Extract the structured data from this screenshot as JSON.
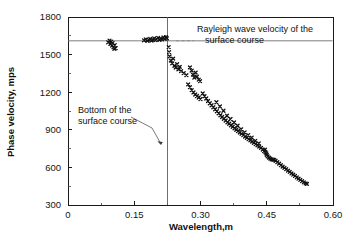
{
  "chart_data": {
    "type": "scatter",
    "title": "",
    "xlabel": "Wavelength,m",
    "ylabel": "Phase velocity, mps",
    "xlim": [
      0,
      0.6
    ],
    "ylim": [
      300,
      1800
    ],
    "xticks": [
      0,
      0.15,
      0.3,
      0.45,
      0.6
    ],
    "xtick_labels": [
      "0",
      "0.15",
      "0.30",
      "0.45",
      "0.60"
    ],
    "yticks": [
      300,
      600,
      900,
      1200,
      1500,
      1800
    ],
    "ytick_labels": [
      "300",
      "600",
      "900",
      "1200",
      "1500",
      "1800"
    ],
    "minor_ticks": true,
    "grid": false,
    "legend": "none",
    "marker": "cross",
    "marker_color": "#111111",
    "reference_lines": [
      {
        "name": "rayleigh-wave-velocity",
        "orientation": "horizontal",
        "value": 1610,
        "label": "Rayleigh wave velocity of the surface course"
      },
      {
        "name": "bottom-of-surface-course",
        "orientation": "vertical",
        "value": 0.225,
        "label": "Bottom of the surface course"
      }
    ],
    "annotations": [
      {
        "name": "rayleigh-annotation",
        "text_line1": "Rayleigh wave velocity of the",
        "text_line2": "surface course",
        "x": 0.375,
        "y": 1700
      },
      {
        "name": "bottom-annotation",
        "text_line1": "Bottom of the",
        "text_line2": "surface course",
        "x": 0.065,
        "y": 1030
      }
    ],
    "points": [
      [
        0.091,
        1598
      ],
      [
        0.094,
        1612
      ],
      [
        0.096,
        1585
      ],
      [
        0.098,
        1604
      ],
      [
        0.1,
        1572
      ],
      [
        0.101,
        1592
      ],
      [
        0.103,
        1560
      ],
      [
        0.105,
        1546
      ],
      [
        0.106,
        1576
      ],
      [
        0.108,
        1552
      ],
      [
        0.172,
        1614
      ],
      [
        0.176,
        1622
      ],
      [
        0.18,
        1610
      ],
      [
        0.183,
        1618
      ],
      [
        0.186,
        1626
      ],
      [
        0.189,
        1612
      ],
      [
        0.192,
        1620
      ],
      [
        0.195,
        1630
      ],
      [
        0.198,
        1616
      ],
      [
        0.201,
        1624
      ],
      [
        0.204,
        1634
      ],
      [
        0.207,
        1618
      ],
      [
        0.21,
        1628
      ],
      [
        0.213,
        1622
      ],
      [
        0.216,
        1636
      ],
      [
        0.219,
        1626
      ],
      [
        0.222,
        1640
      ],
      [
        0.224,
        1630
      ],
      [
        0.228,
        1560
      ],
      [
        0.229,
        1520
      ],
      [
        0.23,
        1486
      ],
      [
        0.233,
        1452
      ],
      [
        0.236,
        1430
      ],
      [
        0.238,
        1468
      ],
      [
        0.241,
        1410
      ],
      [
        0.244,
        1396
      ],
      [
        0.247,
        1424
      ],
      [
        0.25,
        1382
      ],
      [
        0.253,
        1402
      ],
      [
        0.256,
        1368
      ],
      [
        0.262,
        1352
      ],
      [
        0.268,
        1336
      ],
      [
        0.276,
        1398
      ],
      [
        0.28,
        1372
      ],
      [
        0.283,
        1340
      ],
      [
        0.286,
        1316
      ],
      [
        0.289,
        1356
      ],
      [
        0.292,
        1324
      ],
      [
        0.296,
        1300
      ],
      [
        0.299,
        1288
      ],
      [
        0.272,
        1262
      ],
      [
        0.276,
        1240
      ],
      [
        0.28,
        1216
      ],
      [
        0.284,
        1198
      ],
      [
        0.288,
        1182
      ],
      [
        0.292,
        1170
      ],
      [
        0.296,
        1158
      ],
      [
        0.3,
        1146
      ],
      [
        0.305,
        1190
      ],
      [
        0.309,
        1168
      ],
      [
        0.313,
        1150
      ],
      [
        0.317,
        1130
      ],
      [
        0.321,
        1112
      ],
      [
        0.325,
        1096
      ],
      [
        0.329,
        1080
      ],
      [
        0.333,
        1064
      ],
      [
        0.337,
        1048
      ],
      [
        0.341,
        1032
      ],
      [
        0.345,
        1016
      ],
      [
        0.349,
        1002
      ],
      [
        0.353,
        988
      ],
      [
        0.357,
        974
      ],
      [
        0.361,
        960
      ],
      [
        0.365,
        948
      ],
      [
        0.369,
        936
      ],
      [
        0.373,
        924
      ],
      [
        0.377,
        912
      ],
      [
        0.381,
        900
      ],
      [
        0.385,
        890
      ],
      [
        0.389,
        878
      ],
      [
        0.393,
        868
      ],
      [
        0.397,
        858
      ],
      [
        0.401,
        846
      ],
      [
        0.405,
        836
      ],
      [
        0.409,
        826
      ],
      [
        0.413,
        816
      ],
      [
        0.417,
        806
      ],
      [
        0.421,
        796
      ],
      [
        0.425,
        786
      ],
      [
        0.429,
        776
      ],
      [
        0.433,
        766
      ],
      [
        0.336,
        1120
      ],
      [
        0.344,
        1086
      ],
      [
        0.352,
        1052
      ],
      [
        0.36,
        1012
      ],
      [
        0.368,
        986
      ],
      [
        0.376,
        958
      ],
      [
        0.384,
        932
      ],
      [
        0.392,
        904
      ],
      [
        0.4,
        880
      ],
      [
        0.408,
        858
      ],
      [
        0.416,
        838
      ],
      [
        0.424,
        812
      ],
      [
        0.432,
        792
      ],
      [
        0.437,
        756
      ],
      [
        0.441,
        742
      ],
      [
        0.444,
        730
      ],
      [
        0.447,
        722
      ],
      [
        0.45,
        700
      ],
      [
        0.452,
        688
      ],
      [
        0.455,
        678
      ],
      [
        0.458,
        670
      ],
      [
        0.461,
        664
      ],
      [
        0.464,
        662
      ],
      [
        0.467,
        660
      ],
      [
        0.449,
        712
      ],
      [
        0.446,
        742
      ],
      [
        0.47,
        652
      ],
      [
        0.474,
        642
      ],
      [
        0.478,
        630
      ],
      [
        0.482,
        618
      ],
      [
        0.486,
        606
      ],
      [
        0.49,
        596
      ],
      [
        0.494,
        586
      ],
      [
        0.498,
        574
      ],
      [
        0.502,
        564
      ],
      [
        0.506,
        552
      ],
      [
        0.51,
        542
      ],
      [
        0.514,
        532
      ],
      [
        0.518,
        520
      ],
      [
        0.522,
        510
      ],
      [
        0.526,
        500
      ],
      [
        0.53,
        490
      ],
      [
        0.534,
        480
      ],
      [
        0.538,
        472
      ],
      [
        0.541,
        468
      ]
    ]
  }
}
